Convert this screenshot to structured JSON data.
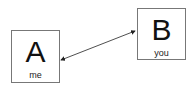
{
  "diagram": {
    "nodes": [
      {
        "id": "A",
        "letter": "A",
        "label": "me"
      },
      {
        "id": "B",
        "letter": "B",
        "label": "you"
      }
    ],
    "edges": [
      {
        "from": "A",
        "to": "B",
        "type": "bidirectional-arrow"
      }
    ],
    "colors": {
      "border": "#777777",
      "text": "#111111",
      "arrow": "#222222"
    }
  }
}
